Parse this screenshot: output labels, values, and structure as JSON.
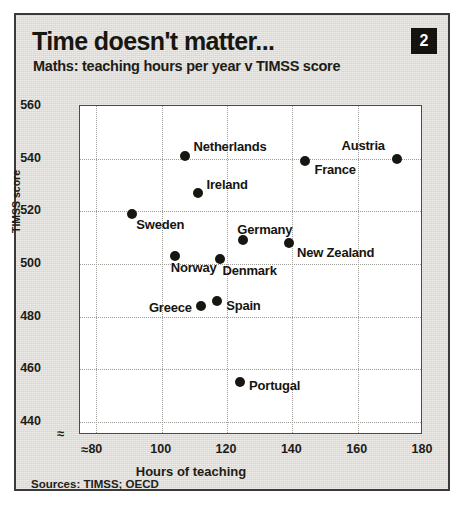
{
  "card": {
    "title": "Time doesn't matter...",
    "badge": "2",
    "subtitle": "Maths: teaching hours per year v TIMSS score",
    "sources": "Sources: TIMSS; OECD",
    "axis_break_glyph": "≈"
  },
  "chart_data": {
    "type": "scatter",
    "title": "Time doesn't matter...",
    "subtitle": "Maths: teaching hours per year v TIMSS score",
    "xlabel": "Hours of teaching",
    "ylabel": "TIMSS score",
    "xlim": [
      75,
      180
    ],
    "ylim": [
      435,
      560
    ],
    "xticks": [
      80,
      100,
      120,
      140,
      160,
      180
    ],
    "yticks": [
      440,
      460,
      480,
      500,
      520,
      540,
      560
    ],
    "grid": true,
    "legend": "none",
    "axis_break_x": true,
    "axis_break_y": true,
    "points": [
      {
        "name": "Netherlands",
        "x": 107,
        "y": 541,
        "label_side": "right"
      },
      {
        "name": "Austria",
        "x": 172,
        "y": 540,
        "label_side": "left"
      },
      {
        "name": "France",
        "x": 144,
        "y": 539,
        "label_side": "right"
      },
      {
        "name": "Ireland",
        "x": 111,
        "y": 527,
        "label_side": "right"
      },
      {
        "name": "Sweden",
        "x": 91,
        "y": 519,
        "label_side": "right"
      },
      {
        "name": "Germany",
        "x": 125,
        "y": 509,
        "label_side": "right"
      },
      {
        "name": "New Zealand",
        "x": 139,
        "y": 508,
        "label_side": "right"
      },
      {
        "name": "Norway",
        "x": 104,
        "y": 503,
        "label_side": "right"
      },
      {
        "name": "Denmark",
        "x": 118,
        "y": 502,
        "label_side": "right"
      },
      {
        "name": "Spain",
        "x": 117,
        "y": 486,
        "label_side": "right"
      },
      {
        "name": "Greece",
        "x": 112,
        "y": 484,
        "label_side": "left"
      },
      {
        "name": "Portugal",
        "x": 124,
        "y": 455,
        "label_side": "right"
      }
    ]
  }
}
